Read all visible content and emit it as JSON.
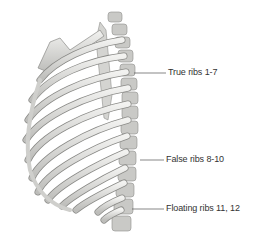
{
  "figure": {
    "labels": [
      {
        "text": "True ribs 1-7",
        "leader_y": 73
      },
      {
        "text": "False ribs 8-10",
        "leader_y": 160
      },
      {
        "text": "Floating ribs 11, 12",
        "leader_y": 209
      }
    ]
  },
  "colors": {
    "bone": "#e6e6e3",
    "bone_shade": "#a9a9a6",
    "outline": "#8a8a87",
    "leader": "#555555",
    "text": "#333333"
  }
}
